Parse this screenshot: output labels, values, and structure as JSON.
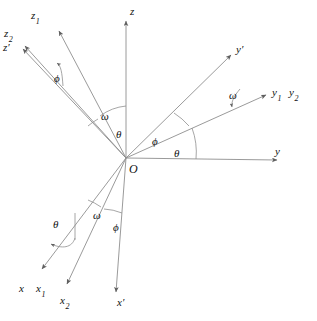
{
  "figure": {
    "background_color": "#ffffff",
    "line_color": "#8a8a8a",
    "text_color": "#111111",
    "origin_label": "O"
  },
  "axes": [
    {
      "name": "z",
      "label": "z",
      "sub": "",
      "prime": false,
      "label_x": 130,
      "label_y": 6,
      "tip_x": 126,
      "tip_y": 19
    },
    {
      "name": "z1",
      "label": "z",
      "sub": "1",
      "prime": false,
      "label_x": 31,
      "label_y": 10,
      "tip_x": 57,
      "tip_y": 29
    },
    {
      "name": "z2",
      "label": "z",
      "sub": "2",
      "prime": false,
      "label_x": 4,
      "label_y": 28,
      "tip_x": 23,
      "tip_y": 44
    },
    {
      "name": "zp",
      "label": "z",
      "sub": "",
      "prime": true,
      "label_x": 3,
      "label_y": 42,
      "tip_x": 21,
      "tip_y": 47
    },
    {
      "name": "yp",
      "label": "y",
      "sub": "",
      "prime": true,
      "label_x": 236,
      "label_y": 44,
      "tip_x": 232,
      "tip_y": 53
    },
    {
      "name": "y1",
      "label": "y",
      "sub": "1",
      "prime": false,
      "label_x": 272,
      "label_y": 87,
      "tip_x": 267,
      "tip_y": 93
    },
    {
      "name": "y2",
      "label": "y",
      "sub": "2",
      "prime": false,
      "label_x": 289,
      "label_y": 87,
      "tip_x": 267,
      "tip_y": 93
    },
    {
      "name": "y",
      "label": "y",
      "sub": "",
      "prime": false,
      "label_x": 275,
      "label_y": 146,
      "tip_x": 278,
      "tip_y": 159
    },
    {
      "name": "x",
      "label": "x",
      "sub": "",
      "prime": false,
      "label_x": 19,
      "label_y": 283,
      "tip_x": 40,
      "tip_y": 271
    },
    {
      "name": "x1",
      "label": "x",
      "sub": "1",
      "prime": false,
      "label_x": 36,
      "label_y": 283,
      "tip_x": 40,
      "tip_y": 271
    },
    {
      "name": "x2",
      "label": "x",
      "sub": "2",
      "prime": false,
      "label_x": 60,
      "label_y": 295,
      "tip_x": 66,
      "tip_y": 286
    },
    {
      "name": "xp",
      "label": "x",
      "sub": "",
      "prime": true,
      "label_x": 117,
      "label_y": 297,
      "tip_x": 116,
      "tip_y": 294
    }
  ],
  "angles": [
    {
      "name": "phi-upper-left",
      "symbol": "ϕ",
      "x": 54,
      "y": 73
    },
    {
      "name": "omega-upper-left",
      "symbol": "ω",
      "x": 101,
      "y": 111
    },
    {
      "name": "theta-upper-left",
      "symbol": "θ",
      "x": 116,
      "y": 129
    },
    {
      "name": "phi-right",
      "symbol": "ϕ",
      "x": 152,
      "y": 136
    },
    {
      "name": "theta-right",
      "symbol": "θ",
      "x": 174,
      "y": 148
    },
    {
      "name": "omega-right",
      "symbol": "ω",
      "x": 229,
      "y": 90
    },
    {
      "name": "omega-lower",
      "symbol": "ω",
      "x": 93,
      "y": 210
    },
    {
      "name": "phi-lower",
      "symbol": "ϕ",
      "x": 113,
      "y": 222
    },
    {
      "name": "theta-lower-left",
      "symbol": "θ",
      "x": 53,
      "y": 219
    }
  ]
}
